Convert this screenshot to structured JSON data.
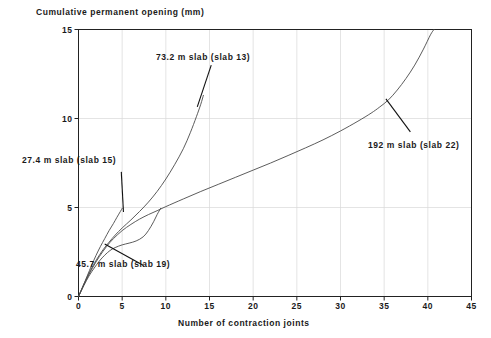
{
  "chart_data": {
    "type": "line",
    "title": "Cumulative permanent opening (mm)",
    "xlabel": "Number of contraction joints",
    "ylabel": "Cumulative permanent opening (mm)",
    "xlim": [
      0,
      45
    ],
    "ylim": [
      0,
      15
    ],
    "xticks": [
      0,
      5,
      10,
      15,
      20,
      25,
      30,
      35,
      40,
      45
    ],
    "yticks": [
      0,
      5,
      10,
      15
    ],
    "grid": true,
    "legend": "none (inline annotations with leader lines)",
    "line_color": "#4a4a4a",
    "axis_color": "#222222",
    "grid_color": "#d8d8d8",
    "series": [
      {
        "name": "27.4 m slab (slab 15)",
        "slab_length_m": 27.4,
        "slab_id": 15,
        "points": [
          [
            0,
            0
          ],
          [
            0.5,
            0.55
          ],
          [
            1,
            1.15
          ],
          [
            1.5,
            1.75
          ],
          [
            2,
            2.3
          ],
          [
            2.5,
            2.8
          ],
          [
            3,
            3.25
          ],
          [
            3.5,
            3.7
          ],
          [
            4,
            4.1
          ],
          [
            4.4,
            4.45
          ],
          [
            4.8,
            4.78
          ],
          [
            5,
            4.95
          ]
        ]
      },
      {
        "name": "45.7 m slab (slab 19)",
        "slab_length_m": 45.7,
        "slab_id": 19,
        "points": [
          [
            0,
            0
          ],
          [
            0.6,
            0.6
          ],
          [
            1.2,
            1.15
          ],
          [
            1.8,
            1.6
          ],
          [
            2.4,
            2.0
          ],
          [
            3,
            2.32
          ],
          [
            3.6,
            2.58
          ],
          [
            4.2,
            2.75
          ],
          [
            5,
            2.9
          ],
          [
            5.8,
            3.0
          ],
          [
            6.6,
            3.12
          ],
          [
            7.4,
            3.35
          ],
          [
            8,
            3.7
          ],
          [
            8.6,
            4.2
          ],
          [
            9,
            4.6
          ],
          [
            9.4,
            4.95
          ]
        ]
      },
      {
        "name": "73.2 m slab (slab 13)",
        "slab_length_m": 73.2,
        "slab_id": 13,
        "points": [
          [
            0,
            0
          ],
          [
            0.7,
            0.8
          ],
          [
            1.4,
            1.5
          ],
          [
            2.1,
            2.1
          ],
          [
            2.8,
            2.62
          ],
          [
            3.5,
            3.05
          ],
          [
            4.2,
            3.45
          ],
          [
            5,
            3.85
          ],
          [
            6,
            4.3
          ],
          [
            7,
            4.78
          ],
          [
            8,
            5.3
          ],
          [
            9,
            5.9
          ],
          [
            10,
            6.6
          ],
          [
            11,
            7.4
          ],
          [
            12,
            8.3
          ],
          [
            12.8,
            9.2
          ],
          [
            13.5,
            10.1
          ],
          [
            14,
            10.8
          ],
          [
            14.3,
            11.3
          ]
        ]
      },
      {
        "name": "192 m slab (slab 22)",
        "slab_length_m": 192,
        "slab_id": 22,
        "points": [
          [
            0,
            0
          ],
          [
            0.8,
            0.85
          ],
          [
            1.6,
            1.6
          ],
          [
            2.4,
            2.25
          ],
          [
            3.2,
            2.8
          ],
          [
            4,
            3.25
          ],
          [
            5,
            3.7
          ],
          [
            6,
            4.05
          ],
          [
            7,
            4.35
          ],
          [
            8,
            4.6
          ],
          [
            9,
            4.82
          ],
          [
            10,
            5.05
          ],
          [
            12,
            5.48
          ],
          [
            14,
            5.9
          ],
          [
            16,
            6.3
          ],
          [
            18,
            6.7
          ],
          [
            20,
            7.1
          ],
          [
            22,
            7.5
          ],
          [
            24,
            7.92
          ],
          [
            26,
            8.35
          ],
          [
            28,
            8.8
          ],
          [
            30,
            9.3
          ],
          [
            32,
            9.85
          ],
          [
            33.5,
            10.3
          ],
          [
            34.5,
            10.65
          ],
          [
            35.5,
            11.05
          ],
          [
            36.5,
            11.6
          ],
          [
            37.5,
            12.25
          ],
          [
            38.5,
            13.0
          ],
          [
            39.5,
            13.9
          ],
          [
            40.3,
            14.7
          ],
          [
            40.7,
            15.0
          ]
        ]
      }
    ],
    "annotations": [
      {
        "label": "27.4 m slab (slab 15)",
        "leader": {
          "from_x": 4.9,
          "from_y": 7.0,
          "to_x": 5.15,
          "to_y": 4.75
        }
      },
      {
        "label": "45.7 m slab (slab 19)",
        "leader": {
          "from_x": 3.0,
          "from_y": 2.95,
          "to_x": 7.4,
          "to_y": 1.75
        }
      },
      {
        "label": "73.2 m slab (slab 13)",
        "leader": {
          "from_x": 15.2,
          "from_y": 13.0,
          "to_x": 13.6,
          "to_y": 10.65
        }
      },
      {
        "label": "192 m slab (slab 22)",
        "leader": {
          "from_x": 35.2,
          "from_y": 11.1,
          "to_x": 38.0,
          "to_y": 9.25
        }
      }
    ]
  }
}
